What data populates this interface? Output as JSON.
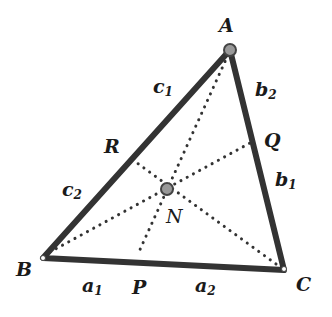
{
  "diagram": {
    "colors": {
      "side": "#333333",
      "cevian": "#333333",
      "point_fill": "#999999",
      "point_stroke": "#444444"
    },
    "vertices": {
      "A": "A",
      "B": "B",
      "C": "C"
    },
    "feet": {
      "P": "P",
      "Q": "Q",
      "R": "R"
    },
    "center": "N",
    "segments": {
      "a1": {
        "base": "a",
        "sub": "1"
      },
      "a2": {
        "base": "a",
        "sub": "2"
      },
      "b1": {
        "base": "b",
        "sub": "1"
      },
      "b2": {
        "base": "b",
        "sub": "2"
      },
      "c1": {
        "base": "c",
        "sub": "1"
      },
      "c2": {
        "base": "c",
        "sub": "2"
      }
    }
  }
}
